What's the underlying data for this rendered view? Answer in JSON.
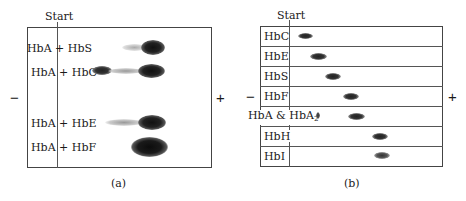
{
  "panel_a": {
    "caption": "(a)",
    "start_label": "Start",
    "minus": "−",
    "plus": "+",
    "lanes": [
      {
        "label": "HbA + HbS",
        "y": 47
      },
      {
        "label": "HbA + HbC",
        "y": 71
      },
      {
        "label": "HbA + HbE",
        "y": 122
      },
      {
        "label": "HbA + HbF",
        "y": 146
      }
    ]
  },
  "panel_b": {
    "caption": "(b)",
    "start_label": "Start",
    "minus": "−",
    "plus": "+",
    "rows": [
      {
        "label": "HbC"
      },
      {
        "label": "HbE"
      },
      {
        "label": "HbS"
      },
      {
        "label": "HbF"
      },
      {
        "label": "HbA & HbA",
        "sub": "2"
      },
      {
        "label": "HbH"
      },
      {
        "label": "HbI"
      }
    ]
  }
}
